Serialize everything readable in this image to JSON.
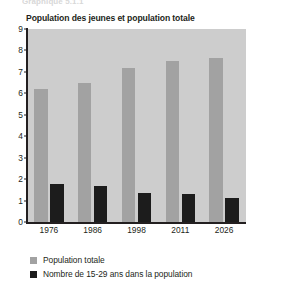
{
  "figure": {
    "cut_off_caption": "Graphique 5.1.1",
    "title": "Population des jeunes et population totale"
  },
  "colors": {
    "plot_background": "#cdcdcd",
    "series_total": "#a2a2a2",
    "series_youth": "#1c1c1c",
    "axis": "#231f20",
    "text": "#231f20"
  },
  "chart_data": {
    "type": "bar",
    "title": "Population des jeunes et population totale",
    "xlabel": "",
    "ylabel": "",
    "categories": [
      "1976",
      "1986",
      "1998",
      "2011",
      "2026"
    ],
    "series": [
      {
        "name": "Population totale",
        "color": "#a2a2a2",
        "values": [
          6.2,
          6.5,
          7.2,
          7.5,
          7.65
        ]
      },
      {
        "name": "Nombre de 15-29 ans dans la population",
        "color": "#1c1c1c",
        "values": [
          1.75,
          1.7,
          1.35,
          1.3,
          1.1
        ]
      }
    ],
    "ylim": [
      0,
      9
    ],
    "yticks": [
      "0",
      "1",
      "2",
      "3",
      "4",
      "5",
      "6",
      "7",
      "8",
      "9"
    ],
    "grid": false,
    "legend_position": "below"
  },
  "legend": {
    "items": [
      {
        "label": "Population totale",
        "color": "#a2a2a2"
      },
      {
        "label": "Nombre de 15-29 ans dans la population",
        "color": "#1c1c1c"
      }
    ]
  }
}
